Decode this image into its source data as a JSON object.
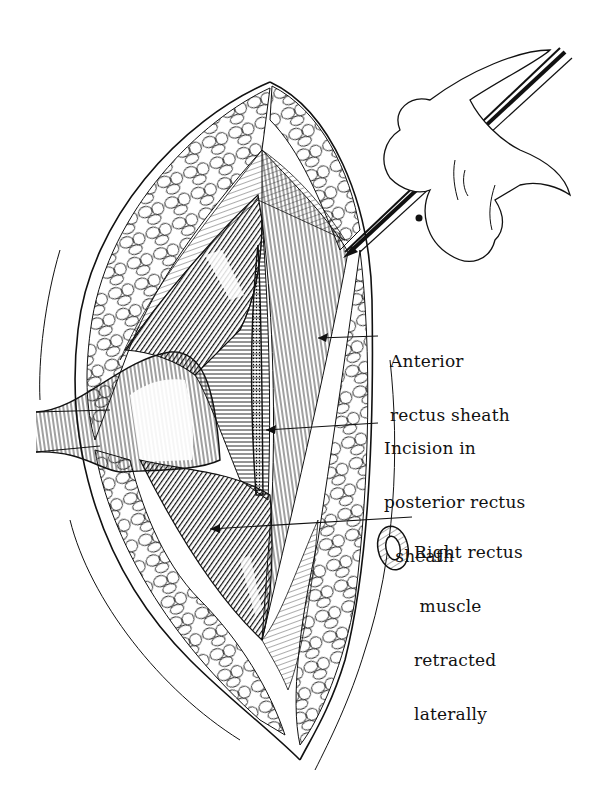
{
  "figure": {
    "type": "surgical-illustration",
    "ink_color": "#111111",
    "background_color": "#ffffff",
    "labels": [
      {
        "id": "anterior-rectus-sheath",
        "lines": [
          "Anterior",
          "rectus sheath"
        ]
      },
      {
        "id": "incision-posterior-rectus-sheath",
        "lines": [
          "Incision in",
          "posterior rectus",
          "  sheath"
        ]
      },
      {
        "id": "right-rectus-muscle",
        "lines": [
          "Right rectus",
          " muscle",
          "retracted",
          "laterally"
        ]
      }
    ]
  }
}
